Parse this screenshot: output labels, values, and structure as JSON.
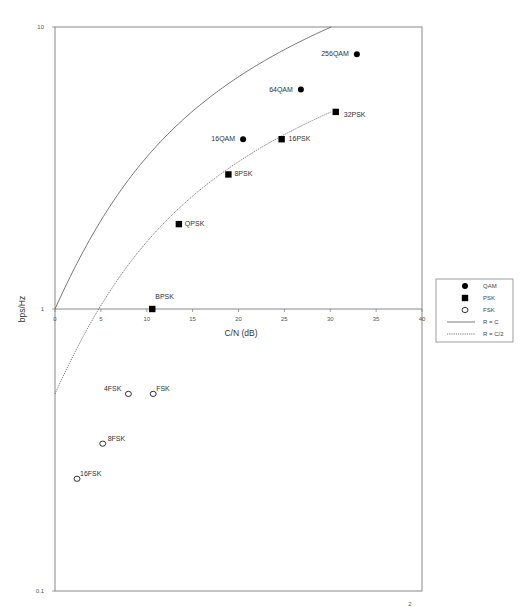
{
  "chart_data": {
    "type": "scatter",
    "title": "",
    "xlabel": "C/N (dB)",
    "ylabel": "bps/Hz",
    "xlim": [
      0,
      40
    ],
    "ylim": [
      0.1,
      10
    ],
    "yscale": "log",
    "grid": false,
    "legend_position": "right",
    "x_ticks": [
      0,
      5,
      10,
      15,
      20,
      25,
      30,
      35,
      40
    ],
    "x_tick_labels": [
      "0",
      "5",
      "10",
      "15",
      "20",
      "25",
      "30",
      "35",
      "40"
    ],
    "y_ticks": [
      0.1,
      1,
      10
    ],
    "y_tick_labels": [
      "0.1",
      "1",
      "10"
    ],
    "series": [
      {
        "name": "QAM",
        "marker": "filled-circle",
        "points": [
          {
            "label": "16QAM",
            "x": 20.5,
            "y": 4
          },
          {
            "label": "64QAM",
            "x": 26.8,
            "y": 6
          },
          {
            "label": "256QAM",
            "x": 32.9,
            "y": 8
          }
        ]
      },
      {
        "name": "PSK",
        "marker": "filled-square",
        "points": [
          {
            "label": "BPSK",
            "x": 10.6,
            "y": 1
          },
          {
            "label": "QPSK",
            "x": 13.5,
            "y": 2
          },
          {
            "label": "8PSK",
            "x": 18.9,
            "y": 3
          },
          {
            "label": "16PSK",
            "x": 24.7,
            "y": 4
          },
          {
            "label": "32PSK",
            "x": 30.6,
            "y": 5
          }
        ]
      },
      {
        "name": "FSK",
        "marker": "open-circle",
        "points": [
          {
            "label": "FSK",
            "x": 10.7,
            "y": 0.5
          },
          {
            "label": "4FSK",
            "x": 8.0,
            "y": 0.5
          },
          {
            "label": "8FSK",
            "x": 5.2,
            "y": 0.333
          },
          {
            "label": "16FSK",
            "x": 2.4,
            "y": 0.25
          }
        ]
      },
      {
        "name": "R = C",
        "style": "solid-line",
        "formula": "C/N(dB) = 10*log10(2^R - 1)",
        "x": [
          0,
          4.8,
          8.5,
          11.8,
          14.9,
          17.9,
          20.8,
          23.8,
          26.7,
          29.2,
          30.1
        ],
        "y": [
          1,
          2,
          3,
          4,
          5,
          6,
          7,
          8,
          9,
          9.8,
          10
        ]
      },
      {
        "name": "R = C/2",
        "style": "dotted-line",
        "formula": "C/N(dB) = 10*log10(2^(2R) - 1)",
        "x": [
          0,
          4.8,
          8.5,
          11.8,
          14.9,
          17.9,
          20.8,
          23.8,
          26.7,
          29.2,
          30.1
        ],
        "y": [
          0.5,
          1,
          1.5,
          2,
          2.5,
          3,
          3.5,
          4,
          4.5,
          4.9,
          5
        ]
      }
    ],
    "legend": [
      {
        "label": "QAM",
        "symbol": "filled-circle"
      },
      {
        "label": "PSK",
        "symbol": "filled-square"
      },
      {
        "label": "FSK",
        "symbol": "open-circle"
      },
      {
        "label": "R = C",
        "symbol": "solid-line"
      },
      {
        "label": "R = C/2",
        "symbol": "dotted-line"
      }
    ],
    "page_marker": "2"
  },
  "colors": {
    "axis": "#888888",
    "marker": "#000000",
    "curve": "#555555",
    "text": "#333333"
  }
}
